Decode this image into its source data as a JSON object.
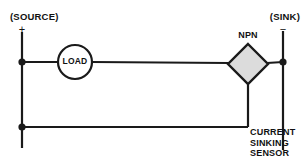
{
  "diagram": {
    "labels": {
      "source": "(SOURCE)",
      "sink": "(SINK)",
      "plus": "+",
      "minus": "−",
      "npn": "NPN",
      "load": "LOAD",
      "sensor_line1": "CURRENT",
      "sensor_line2": "SINKING",
      "sensor_line3": "SENSOR"
    },
    "colors": {
      "wire": "#1a1a1a",
      "background": "#ffffff",
      "transistor_fill": "#dcdcdc",
      "transistor_stroke": "#1a1a1a",
      "text": "#111111"
    },
    "components": {
      "load": {
        "type": "circle",
        "cx": 75,
        "cy": 62,
        "r": 17
      },
      "npn_transistor": {
        "type": "diamond",
        "cx": 248,
        "cy": 64,
        "half_width": 20,
        "half_height": 20
      },
      "junction_dots": [
        {
          "cx": 22,
          "cy": 62
        },
        {
          "cx": 22,
          "cy": 127
        },
        {
          "cx": 283,
          "cy": 62
        }
      ]
    }
  }
}
